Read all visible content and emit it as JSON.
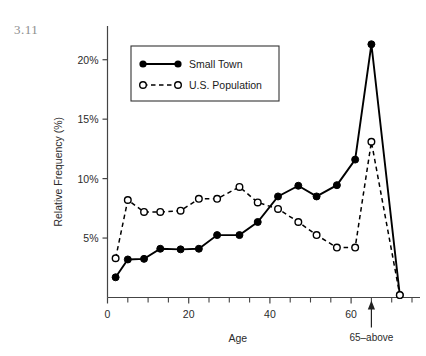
{
  "figure_number": "3.11",
  "chart_data": {
    "type": "line",
    "title": "",
    "xlabel": "Age",
    "ylabel": "Relative Frequency (%)",
    "xlim": [
      0,
      75
    ],
    "ylim": [
      0,
      22.5
    ],
    "xticks_major": [
      0,
      20,
      40,
      60
    ],
    "xticks_major_labels": [
      "0",
      "20",
      "40",
      "60"
    ],
    "xticks_minor": [
      5,
      10,
      15,
      25,
      30,
      35,
      45,
      50,
      55,
      65,
      70,
      75
    ],
    "yticks": [
      5,
      10,
      15,
      20
    ],
    "ytick_labels": [
      "5%",
      "10%",
      "15%",
      "20%"
    ],
    "grid": false,
    "legend_position": "upper-left-inset",
    "annotations": [
      {
        "name": "65-above",
        "text": "65–above",
        "x": 65,
        "y": 0,
        "arrow": "up"
      }
    ],
    "series": [
      {
        "name": "Small Town",
        "style": "solid",
        "marker": "filled-circle",
        "color": "#000000",
        "x": [
          2,
          5,
          9,
          13,
          18,
          22.5,
          27,
          32.5,
          37,
          42,
          47,
          51.5,
          56.5,
          61,
          65,
          72
        ],
        "values": [
          1.7,
          3.2,
          3.25,
          4.1,
          4.05,
          4.1,
          5.25,
          5.25,
          6.35,
          8.5,
          9.4,
          8.5,
          9.45,
          11.6,
          21.3,
          0.2
        ]
      },
      {
        "name": "U.S. Population",
        "style": "dashed",
        "marker": "open-circle",
        "color": "#000000",
        "x": [
          2,
          5,
          9,
          13,
          18,
          22.5,
          27,
          32.5,
          37,
          42,
          47,
          51.5,
          56.5,
          61,
          65,
          72
        ],
        "values": [
          3.3,
          8.2,
          7.2,
          7.2,
          7.3,
          8.3,
          8.3,
          9.3,
          8.0,
          7.45,
          6.35,
          5.25,
          4.2,
          4.2,
          13.1,
          0.2
        ]
      }
    ]
  },
  "legend": {
    "entries": [
      {
        "label": "Small Town"
      },
      {
        "label": "U.S. Population"
      }
    ]
  }
}
